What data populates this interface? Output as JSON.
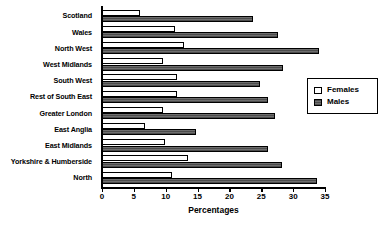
{
  "chart_data": {
    "type": "bar",
    "orientation": "horizontal",
    "title": "",
    "xlabel": "Percentages",
    "ylabel": "",
    "xlim": [
      0,
      35
    ],
    "xticks": [
      0,
      5,
      10,
      15,
      20,
      25,
      30,
      35
    ],
    "grid": false,
    "legend_position": "right",
    "categories": [
      "Scotland",
      "Wales",
      "North West",
      "West Midlands",
      "South West",
      "Rest of South East",
      "Greater London",
      "East Anglia",
      "East Midlands",
      "Yorkshire & Humberside",
      "North"
    ],
    "series": [
      {
        "name": "Females",
        "color": "#ffffff",
        "values": [
          6.0,
          11.5,
          12.9,
          9.6,
          11.8,
          11.8,
          9.6,
          6.8,
          9.9,
          13.5,
          11.0
        ]
      },
      {
        "name": "Males",
        "color": "#5a5a5a",
        "values": [
          23.7,
          27.6,
          34.0,
          28.4,
          24.8,
          26.0,
          27.2,
          14.8,
          26.0,
          28.3,
          33.8
        ]
      }
    ]
  },
  "legend": {
    "items": [
      {
        "label": "Females",
        "swatch": "females"
      },
      {
        "label": "Males",
        "swatch": "males"
      }
    ]
  }
}
